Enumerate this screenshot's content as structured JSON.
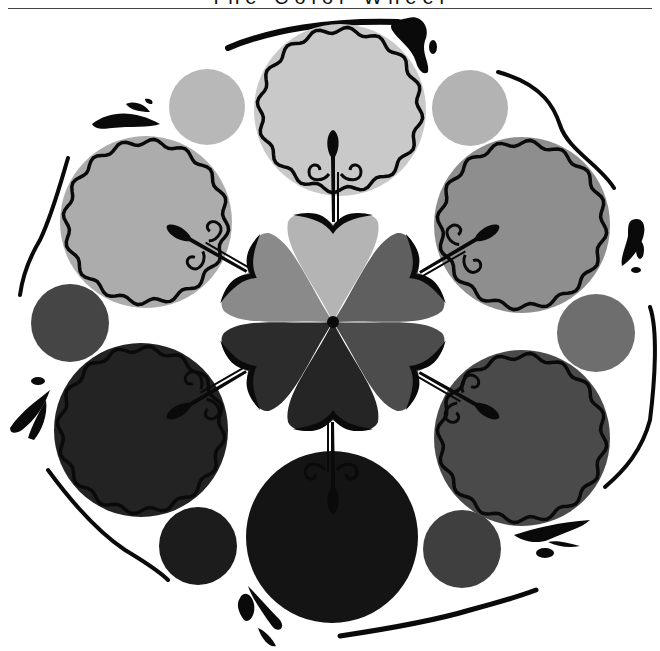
{
  "title": "The Color Wheel",
  "wheel": {
    "center": [
      333,
      322
    ],
    "large_circles": [
      {
        "name": "top",
        "cx": 340,
        "cy": 110,
        "r": 84,
        "fill": "#c9c9c9",
        "scalloped": true
      },
      {
        "name": "upper-right",
        "cx": 522,
        "cy": 225,
        "r": 86,
        "fill": "#8e8e8e",
        "scalloped": true
      },
      {
        "name": "lower-right",
        "cx": 522,
        "cy": 438,
        "r": 86,
        "fill": "#4a4a4a",
        "scalloped": true
      },
      {
        "name": "bottom",
        "cx": 332,
        "cy": 537,
        "r": 84,
        "fill": "#141414",
        "scalloped": false
      },
      {
        "name": "lower-left",
        "cx": 141,
        "cy": 430,
        "r": 85,
        "fill": "#232323",
        "scalloped": true
      },
      {
        "name": "upper-left",
        "cx": 146,
        "cy": 222,
        "r": 84,
        "fill": "#acacac",
        "scalloped": true
      }
    ],
    "small_circles": [
      {
        "name": "top-left",
        "cx": 207,
        "cy": 107,
        "r": 38,
        "fill": "#b8b8b8"
      },
      {
        "name": "top-right",
        "cx": 470,
        "cy": 108,
        "r": 38,
        "fill": "#b3b3b3"
      },
      {
        "name": "right",
        "cx": 596,
        "cy": 333,
        "r": 39,
        "fill": "#6e6e6e"
      },
      {
        "name": "bottom-right",
        "cx": 462,
        "cy": 549,
        "r": 39,
        "fill": "#3f3f3f"
      },
      {
        "name": "bottom-left",
        "cx": 198,
        "cy": 546,
        "r": 39,
        "fill": "#1c1c1c"
      },
      {
        "name": "left",
        "cx": 70,
        "cy": 323,
        "r": 39,
        "fill": "#454545"
      }
    ],
    "petals": [
      {
        "angle": 0,
        "fill": "#b4b4b4"
      },
      {
        "angle": 60,
        "fill": "#5f5f5f"
      },
      {
        "angle": 120,
        "fill": "#4c4c4c"
      },
      {
        "angle": 180,
        "fill": "#252525"
      },
      {
        "angle": 240,
        "fill": "#2c2c2c"
      },
      {
        "angle": 300,
        "fill": "#8a8a8a"
      }
    ],
    "ink_color": "#0a0a0a"
  }
}
